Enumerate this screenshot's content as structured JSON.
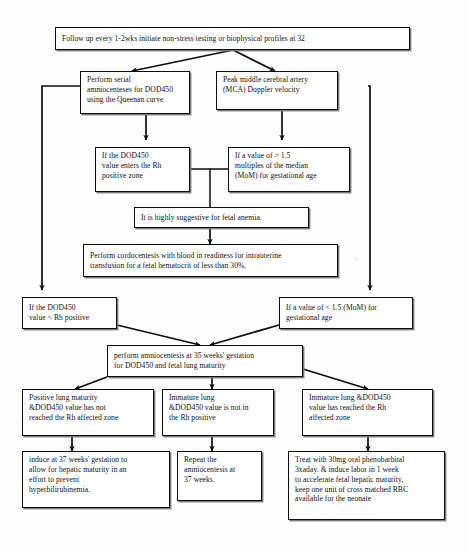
{
  "diagram": {
    "line_color": "#0d0d0d",
    "box_fill": "#ffffff",
    "shadow_color": "#7a7a7a",
    "nodes": [
      {
        "id": "followup",
        "name": "node-follow-up",
        "lines": [
          "Follow up every 1-2wks initiate non-stress testing or biophysical profiles at 32"
        ]
      },
      {
        "id": "serial-amnio",
        "name": "node-perform-serial-amniocenteses",
        "lines": [
          "Perform serial",
          "amniocenteses for DOD450",
          "using the Queenan curve"
        ]
      },
      {
        "id": "mca",
        "name": "node-peak-mca-doppler",
        "lines": [
          "Peak middle cerebral artery",
          "(MCA) Doppler velocity"
        ]
      },
      {
        "id": "dod450-enters",
        "name": "node-dod450-enters-rh-positive-zone",
        "lines": [
          "If the DOD450",
          "value enters the Rh",
          "positive zone"
        ]
      },
      {
        "id": "mom-high",
        "name": "node-value-greater-1-5-mom",
        "lines": [
          "If a value of > 1.5",
          "multiples of the median",
          "(MoM) for gestational age"
        ]
      },
      {
        "id": "anemia",
        "name": "node-highly-suggestive-fetal-anemia",
        "lines": [
          "It is highly suggestive for fetal anemia."
        ]
      },
      {
        "id": "cordocentesis",
        "name": "node-perform-cordocentesis",
        "lines": [
          "Perform cordocentesis with blood in readiness for intrauterine",
          "transfusion for a fetal hematocrit of less than 30%."
        ]
      },
      {
        "id": "dod450-less",
        "name": "node-dod450-less-than-rh-positive",
        "lines": [
          "If the DOD450",
          "value <  Rh positive"
        ]
      },
      {
        "id": "mom-low",
        "name": "node-value-less-1-5-mom",
        "lines": [
          "If a value of < 1.5 (MoM) for",
          "gestational age"
        ]
      },
      {
        "id": "amnio35",
        "name": "node-perform-amniocentesis-35-weeks",
        "lines": [
          "perform amniocentesis at 35 weeks' gestation",
          "for DOD450 and fetal lung maturity"
        ]
      },
      {
        "id": "positive-lung",
        "name": "node-positive-lung-maturity",
        "lines": [
          "Positive lung maturity",
          "&DOD450 value has not",
          "reached the Rh affected zone"
        ]
      },
      {
        "id": "immature-not-rh",
        "name": "node-immature-lung-not-rh-positive",
        "lines": [
          "Immature lung",
          "&DOD450 value is not in",
          "the Rh positive"
        ]
      },
      {
        "id": "immature-reached",
        "name": "node-immature-lung-reached-rh-zone",
        "lines": [
          "Immature lung  &DOD450",
          "value has reached the Rh",
          "affected zone"
        ]
      },
      {
        "id": "induce37",
        "name": "node-induce-at-37-weeks",
        "lines": [
          "induce at 37 weeks' gestation to",
          "allow for hepatic maturity in an",
          "effort to prevent",
          "hyperbilirubinemia."
        ]
      },
      {
        "id": "repeat-amnio",
        "name": "node-repeat-amniocentesis",
        "lines": [
          "Repeat the",
          "amniocentesis at",
          "37 weeks."
        ]
      },
      {
        "id": "phenobarbital",
        "name": "node-treat-with-phenobarbital",
        "lines": [
          "Treat with 30mg oral phenobarbital",
          "3xaday. & induce labor in 1 week",
          "to accelerate fetal hepatic maturity,",
          "keep one unit of  cross matched RBC",
          "available for the neonate"
        ]
      }
    ],
    "edges": [
      {
        "name": "edge-followup-to-serial-amnio",
        "from": "followup",
        "to": "serial-amnio",
        "style": "diagonal-arrow"
      },
      {
        "name": "edge-followup-to-mca",
        "from": "followup",
        "to": "mca",
        "style": "diagonal-arrow"
      },
      {
        "name": "edge-serial-amnio-to-dod450-enters",
        "from": "serial-amnio",
        "to": "dod450-enters",
        "style": "vertical-arrow"
      },
      {
        "name": "edge-mca-to-mom-high",
        "from": "mca",
        "to": "mom-high",
        "style": "vertical-arrow"
      },
      {
        "name": "edge-dod450-enters-to-anemia",
        "from": "dod450-enters",
        "to": "anemia",
        "style": "elbow-arrow"
      },
      {
        "name": "edge-mom-high-to-anemia",
        "from": "mom-high",
        "to": "anemia",
        "style": "elbow-arrow"
      },
      {
        "name": "edge-anemia-to-cordocentesis",
        "from": "anemia",
        "to": "cordocentesis",
        "style": "vertical-arrow"
      },
      {
        "name": "edge-serial-amnio-to-dod450-less",
        "from": "serial-amnio",
        "to": "dod450-less",
        "style": "left-bus-arrow"
      },
      {
        "name": "edge-mca-to-mom-low",
        "from": "mca",
        "to": "mom-low",
        "style": "right-bus-arrow"
      },
      {
        "name": "edge-dod450-less-to-amnio35",
        "from": "dod450-less",
        "to": "amnio35",
        "style": "diagonal-arrow"
      },
      {
        "name": "edge-mom-low-to-amnio35",
        "from": "mom-low",
        "to": "amnio35",
        "style": "diagonal-arrow"
      },
      {
        "name": "edge-amnio35-to-positive-lung",
        "from": "amnio35",
        "to": "positive-lung",
        "style": "diagonal-arrow"
      },
      {
        "name": "edge-amnio35-to-immature-not-rh",
        "from": "amnio35",
        "to": "immature-not-rh",
        "style": "vertical-arrow"
      },
      {
        "name": "edge-amnio35-to-immature-reached",
        "from": "amnio35",
        "to": "immature-reached",
        "style": "diagonal-arrow"
      },
      {
        "name": "edge-positive-lung-to-induce37",
        "from": "positive-lung",
        "to": "induce37",
        "style": "vertical-arrow"
      },
      {
        "name": "edge-immature-not-rh-to-repeat-amnio",
        "from": "immature-not-rh",
        "to": "repeat-amnio",
        "style": "vertical-arrow"
      },
      {
        "name": "edge-immature-reached-to-phenobarbital",
        "from": "immature-reached",
        "to": "phenobarbital",
        "style": "vertical-arrow"
      }
    ],
    "artifact_mark": "·."
  }
}
